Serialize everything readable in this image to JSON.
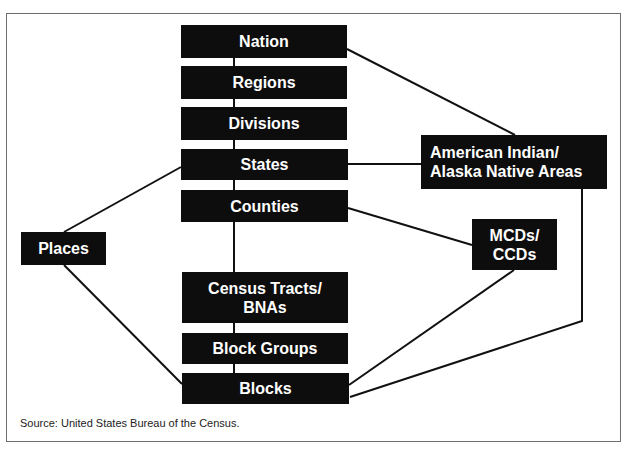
{
  "diagram": {
    "type": "hierarchy",
    "nodes": [
      {
        "id": "nation",
        "label": "Nation"
      },
      {
        "id": "regions",
        "label": "Regions"
      },
      {
        "id": "divisions",
        "label": "Divisions"
      },
      {
        "id": "states",
        "label": "States"
      },
      {
        "id": "counties",
        "label": "Counties"
      },
      {
        "id": "tracts",
        "label": "Census Tracts/\nBNAs"
      },
      {
        "id": "blockgroups",
        "label": "Block Groups"
      },
      {
        "id": "blocks",
        "label": "Blocks"
      },
      {
        "id": "places",
        "label": "Places"
      },
      {
        "id": "aiana",
        "label": "American Indian/\nAlaska Native Areas"
      },
      {
        "id": "mcds",
        "label": "MCDs/\nCCDs"
      }
    ],
    "edges": [
      [
        "nation",
        "regions"
      ],
      [
        "regions",
        "divisions"
      ],
      [
        "divisions",
        "states"
      ],
      [
        "states",
        "counties"
      ],
      [
        "counties",
        "tracts"
      ],
      [
        "tracts",
        "blockgroups"
      ],
      [
        "blockgroups",
        "blocks"
      ],
      [
        "nation",
        "aiana"
      ],
      [
        "states",
        "aiana"
      ],
      [
        "states",
        "places"
      ],
      [
        "places",
        "blocks"
      ],
      [
        "counties",
        "mcds"
      ],
      [
        "mcds",
        "blocks"
      ],
      [
        "aiana",
        "blocks"
      ]
    ],
    "source": "Source: United States Bureau of the Census."
  }
}
